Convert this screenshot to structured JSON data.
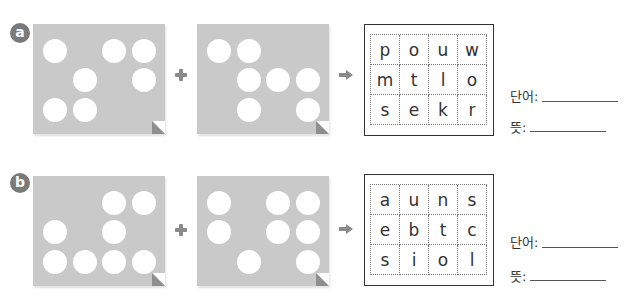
{
  "colors": {
    "card": "#c9c9c9",
    "badge": "#7a7a7a",
    "operator": "#8a8a8a",
    "box_border": "#333333"
  },
  "exercises": [
    {
      "badge": "a",
      "card1_holes": [
        [
          0,
          0
        ],
        [
          2,
          0
        ],
        [
          3,
          0
        ],
        [
          1,
          1
        ],
        [
          3,
          1
        ],
        [
          0,
          2
        ],
        [
          1,
          2
        ]
      ],
      "card2_holes": [
        [
          0,
          0
        ],
        [
          1,
          0
        ],
        [
          1,
          1
        ],
        [
          2,
          1
        ],
        [
          3,
          1
        ],
        [
          1,
          2
        ],
        [
          3,
          2
        ]
      ],
      "operator_plus": "plus-icon",
      "operator_arrow": "arrow-right-icon",
      "letters": [
        [
          "p",
          "o",
          "u",
          "w"
        ],
        [
          "m",
          "t",
          "l",
          "o"
        ],
        [
          "s",
          "e",
          "k",
          "r"
        ]
      ],
      "word_label": "단어:",
      "meaning_label": "뜻:",
      "word_value": "",
      "meaning_value": ""
    },
    {
      "badge": "b",
      "card1_holes": [
        [
          2,
          0
        ],
        [
          3,
          0
        ],
        [
          0,
          1
        ],
        [
          2,
          1
        ],
        [
          0,
          2
        ],
        [
          1,
          2
        ],
        [
          2,
          2
        ],
        [
          3,
          2
        ]
      ],
      "card2_holes": [
        [
          0,
          0
        ],
        [
          2,
          0
        ],
        [
          3,
          0
        ],
        [
          0,
          1
        ],
        [
          2,
          1
        ],
        [
          3,
          1
        ],
        [
          1,
          2
        ],
        [
          3,
          2
        ]
      ],
      "operator_plus": "plus-icon",
      "operator_arrow": "arrow-right-icon",
      "letters": [
        [
          "a",
          "u",
          "n",
          "s"
        ],
        [
          "e",
          "b",
          "t",
          "c"
        ],
        [
          "s",
          "i",
          "o",
          "l"
        ]
      ],
      "word_label": "단어:",
      "meaning_label": "뜻:",
      "word_value": "",
      "meaning_value": ""
    }
  ]
}
